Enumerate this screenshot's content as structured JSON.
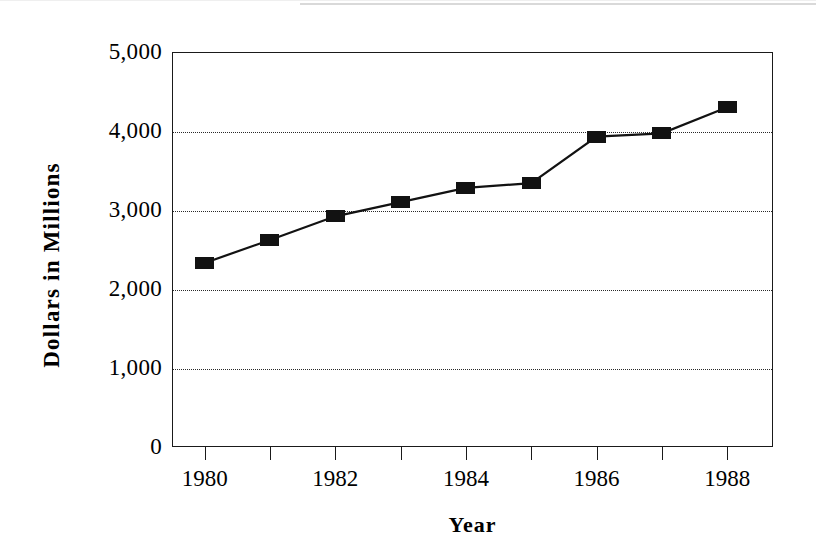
{
  "chart_data": {
    "type": "line",
    "title": "",
    "xlabel": "Year",
    "ylabel": "Dollars  in  Millions",
    "x": [
      1980,
      1981,
      1982,
      1983,
      1984,
      1985,
      1986,
      1987,
      1988
    ],
    "values": [
      2330,
      2620,
      2920,
      3100,
      3280,
      3340,
      3930,
      3970,
      4300
    ],
    "series": [
      {
        "name": "Dollars in Millions",
        "values": [
          2330,
          2620,
          2920,
          3100,
          3280,
          3340,
          3930,
          3970,
          4300
        ]
      }
    ],
    "xlim": [
      1979.5,
      1988.7
    ],
    "ylim": [
      0,
      5000
    ],
    "ytick_values": [
      0,
      1000,
      2000,
      3000,
      4000,
      5000
    ],
    "ytick_labels": [
      "0",
      "1,000",
      "2,000",
      "3,000",
      "4,000",
      "5,000"
    ],
    "xtick_values": [
      1980,
      1981,
      1982,
      1983,
      1984,
      1985,
      1986,
      1987,
      1988
    ],
    "xtick_labels": [
      "1980",
      "",
      "1982",
      "",
      "1984",
      "",
      "1986",
      "",
      "1988"
    ],
    "grid": "horizontal-dotted",
    "gridline_values": [
      1000,
      2000,
      3000,
      4000
    ],
    "legend": "none",
    "marker": "filled-rectangle",
    "line_color": "#121212",
    "marker_color": "#121212",
    "grid_color": "#2a2a2a",
    "frame_color": "#1a1a1a",
    "background_color": "#ffffff"
  },
  "axes": {
    "y_title": "Dollars  in  Millions",
    "x_title": "Year",
    "y_labels": [
      "5,000",
      "4,000",
      "3,000",
      "2,000",
      "1,000",
      "0"
    ],
    "x_labels": [
      "1980",
      "1982",
      "1984",
      "1986",
      "1988"
    ]
  }
}
